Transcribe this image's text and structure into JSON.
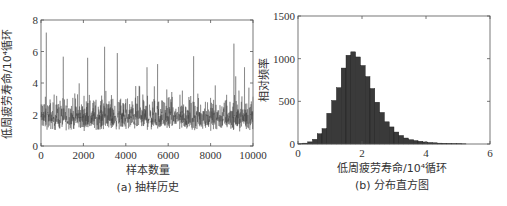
{
  "chart_data": [
    {
      "id": "a",
      "type": "line",
      "title": "",
      "caption": "(a) 抽样历史",
      "xlabel": "样本数量",
      "ylabel": "低周疲劳寿命/10⁴循环",
      "xlim": [
        0,
        10000
      ],
      "ylim": [
        0,
        8
      ],
      "xticks": [
        0,
        2000,
        4000,
        6000,
        8000,
        10000
      ],
      "xtick_labels": [
        "0",
        "2000",
        "4000",
        "6000",
        "8000",
        "10000"
      ],
      "yticks": [
        0,
        2,
        4,
        6,
        8
      ],
      "ytick_labels": [
        "0",
        "2",
        "4",
        "6",
        "8"
      ],
      "grid": false,
      "series": [
        {
          "name": "MCMC trace",
          "description": "noisy sampling history fluctuating mainly between ~0.5 and ~3.5, mean ~1.8",
          "mean": 1.8,
          "band": [
            0.5,
            3.5
          ],
          "spikes": [
            {
              "x": 250,
              "y": 7.2
            },
            {
              "x": 2200,
              "y": 5.6
            },
            {
              "x": 3000,
              "y": 6.3
            },
            {
              "x": 3600,
              "y": 5.9
            },
            {
              "x": 5000,
              "y": 5.0
            },
            {
              "x": 5500,
              "y": 5.2
            },
            {
              "x": 7200,
              "y": 5.7
            },
            {
              "x": 9100,
              "y": 6.5
            },
            {
              "x": 9600,
              "y": 5.0
            }
          ]
        }
      ]
    },
    {
      "id": "b",
      "type": "bar",
      "title": "",
      "caption": "(b) 分布直方图",
      "xlabel": "低周疲劳寿命/10⁴循环",
      "ylabel": "相对频率",
      "xlim": [
        0,
        6
      ],
      "ylim": [
        0,
        1500
      ],
      "xticks": [
        0,
        2,
        4,
        6
      ],
      "xtick_labels": [
        "0",
        "2",
        "4",
        "6"
      ],
      "yticks": [
        0,
        500,
        1000,
        1500
      ],
      "ytick_labels": [
        "0",
        "500",
        "1000",
        "1500"
      ],
      "grid": false,
      "bin_width": 0.15,
      "bin_start": 0.0,
      "values": [
        3,
        10,
        25,
        55,
        120,
        180,
        360,
        510,
        660,
        890,
        1040,
        1080,
        1020,
        920,
        790,
        650,
        490,
        370,
        260,
        200,
        140,
        100,
        70,
        50,
        40,
        32,
        24,
        18,
        14,
        10,
        8,
        6,
        4,
        3,
        2
      ]
    }
  ],
  "layout": {
    "bar_color": "#3a3a3a",
    "line_color": "#3c3c3c",
    "axis_color": "#555555"
  }
}
